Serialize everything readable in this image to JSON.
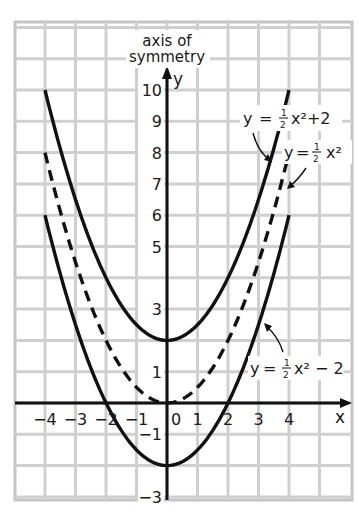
{
  "chart_data": {
    "type": "line",
    "title": "",
    "xlabel": "x",
    "ylabel": "y",
    "annotation": "axis of symmetry",
    "xlim": [
      -5,
      6
    ],
    "ylim": [
      -3,
      12
    ],
    "grid": true,
    "x_tick_labels": [
      "-4",
      "-3",
      "-2",
      "-1",
      "0",
      "1",
      "2",
      "3",
      "4"
    ],
    "y_tick_labels": [
      "10",
      "9",
      "8",
      "7",
      "6",
      "5",
      "3",
      "1",
      "-1",
      "-3"
    ],
    "y_tick_values": [
      10,
      9,
      8,
      7,
      6,
      5,
      3,
      1,
      -1,
      -3
    ],
    "series": [
      {
        "name": "y = ½x² + 2",
        "style": "solid",
        "x": [
          -4,
          -3,
          -2,
          -1,
          0,
          1,
          2,
          3,
          4
        ],
        "y": [
          10,
          6.5,
          4,
          2.5,
          2,
          2.5,
          4,
          6.5,
          10
        ]
      },
      {
        "name": "y = ½x²",
        "style": "dashed",
        "x": [
          -4,
          -3,
          -2,
          -1,
          0,
          1,
          2,
          3,
          4
        ],
        "y": [
          8,
          4.5,
          2,
          0.5,
          0,
          0.5,
          2,
          4.5,
          8
        ]
      },
      {
        "name": "y = ½x² − 2",
        "style": "solid",
        "x": [
          -4,
          -3,
          -2,
          -1,
          0,
          1,
          2,
          3,
          4
        ],
        "y": [
          6,
          2.5,
          0,
          -1.5,
          -2,
          -1.5,
          0,
          2.5,
          6
        ]
      }
    ],
    "labels": {
      "top": {
        "y": "y",
        "eq": "=",
        "num": "1",
        "den": "2",
        "tail": "x²+2"
      },
      "mid": {
        "y": "y",
        "eq": "=",
        "num": "1",
        "den": "2",
        "tail": "x²"
      },
      "bot": {
        "y": "y",
        "eq": "=",
        "num": "1",
        "den": "2",
        "tail": "x² − 2"
      }
    },
    "axis_annotation_line1": "axis of",
    "axis_annotation_line2": "symmetry"
  }
}
